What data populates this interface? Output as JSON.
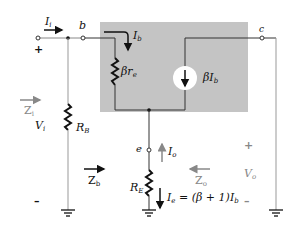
{
  "diagram": {
    "colors": {
      "shade": "#c4c4c4",
      "wire": "#222222",
      "gray_label": "#8a8a8a",
      "wire_light": "#9a9a9a"
    },
    "nodes": {
      "base": "b",
      "collector": "c",
      "emitter": "e"
    },
    "components": {
      "RB": {
        "name": "R",
        "sub": "B"
      },
      "beta_re": {
        "name": "βr",
        "sub": "e"
      },
      "current_source": {
        "name": "βI",
        "sub": "b"
      },
      "RE": {
        "name": "R",
        "sub": "E"
      }
    },
    "currents": {
      "Ii": {
        "name": "I",
        "sub": "i"
      },
      "Ib": {
        "name": "I",
        "sub": "b"
      },
      "Io": {
        "name": "I",
        "sub": "o"
      },
      "Ie": {
        "name": "I",
        "sub": "e",
        "expr": " = (β + 1)I",
        "expr_sub": "b"
      }
    },
    "impedances": {
      "Zi": {
        "name": "Z",
        "sub": "i"
      },
      "Zb": {
        "name": "Z",
        "sub": "b"
      },
      "Zo": {
        "name": "Z",
        "sub": "o"
      }
    },
    "voltages": {
      "Vi": {
        "name": "V",
        "sub": "i",
        "plus": "+",
        "minus": "–"
      },
      "Vo": {
        "name": "V",
        "sub": "o",
        "plus": "+",
        "minus": "–"
      }
    }
  }
}
